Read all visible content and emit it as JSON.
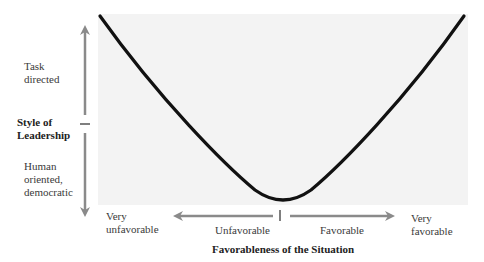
{
  "diagram": {
    "type": "u-curve",
    "title": "",
    "y_axis": {
      "label": "Style of Leadership",
      "label_lines": [
        "Style of",
        "Leadership"
      ],
      "top_label_lines": [
        "Task",
        "directed"
      ],
      "bottom_label_lines": [
        "Human",
        "oriented,",
        "democratic"
      ]
    },
    "x_axis": {
      "label": "Favorableness of the Situation",
      "left_end_lines": [
        "Very",
        "unfavorable"
      ],
      "left_arrow_label": "Unfavorable",
      "right_arrow_label": "Favorable",
      "right_end_lines": [
        "Very",
        "favorable"
      ]
    },
    "curve": {
      "description": "U-shaped curve: task-directed leadership at very unfavorable and very favorable situations, human-oriented in the middle",
      "points": [
        [
          0,
          1.0
        ],
        [
          0.25,
          0.5
        ],
        [
          0.5,
          0.0
        ],
        [
          0.75,
          0.5
        ],
        [
          1.0,
          1.0
        ]
      ]
    },
    "colors": {
      "curve": "#111111",
      "arrows": "#8a8a8a",
      "panel": "#f3f3f3"
    }
  }
}
